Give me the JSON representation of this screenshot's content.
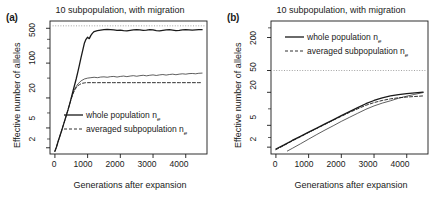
{
  "figure": {
    "width": 441,
    "height": 199,
    "background": "#ffffff",
    "line_color": "#1a1a1a",
    "ref_line_color": "#999999"
  },
  "panels": [
    {
      "id": "a",
      "label": "(a)",
      "title": "10 subpopulation, with migration",
      "xlabel": "Generations after expansion",
      "ylabel": "Effective number of alleles"
    },
    {
      "id": "b",
      "label": "(b)",
      "title": "10 subpopulation, with migration",
      "xlabel": "Generations after expansion",
      "ylabel": "Effective number of alleles"
    }
  ],
  "legend": {
    "whole_label": "whole population n",
    "whole_sub": "e",
    "averaged_label": "averaged subpopulation n",
    "averaged_sub": "e"
  },
  "chart_data": [
    {
      "type": "line",
      "panel": "a",
      "title": "10 subpopulation, with migration",
      "xlabel": "Generations after expansion",
      "ylabel": "Effective number of alleles",
      "xlim": [
        -150,
        4650
      ],
      "ylim": [
        1.5,
        700
      ],
      "yscale": "log",
      "xscale": "linear",
      "xticks": [
        0,
        1000,
        2000,
        3000,
        4000
      ],
      "xtick_labels": [
        "0",
        "1000",
        "2000",
        "3000",
        "4000"
      ],
      "yticks": [
        2,
        5,
        20,
        100,
        500
      ],
      "ytick_labels": [
        "2",
        "5",
        "20",
        "100",
        "500"
      ],
      "grid": false,
      "legend_position": "bottom-center",
      "reference_line": {
        "y": 560,
        "style": "dotted",
        "orientation": "horizontal"
      },
      "series": [
        {
          "name": "whole population ne",
          "style": "solid",
          "x": [
            0,
            50,
            100,
            150,
            200,
            250,
            300,
            350,
            400,
            450,
            500,
            550,
            600,
            650,
            700,
            750,
            800,
            850,
            900,
            950,
            1000,
            1050,
            1100,
            1150,
            1200,
            1300,
            1400,
            1500,
            1600,
            1700,
            1800,
            1900,
            2000,
            2100,
            2200,
            2300,
            2400,
            2500,
            2600,
            2700,
            2800,
            2900,
            3000,
            3100,
            3200,
            3300,
            3400,
            3500,
            3600,
            3700,
            3800,
            3900,
            4000,
            4100,
            4200,
            4300,
            4400,
            4500
          ],
          "y": [
            1.7,
            2.1,
            2.7,
            3.4,
            4.3,
            5.5,
            7.0,
            9.0,
            11.5,
            15.0,
            20.0,
            27.0,
            36.0,
            48.0,
            66.0,
            92.0,
            130.0,
            180.0,
            250.0,
            300.0,
            330.0,
            310.0,
            360.0,
            400.0,
            430.0,
            450.0,
            460.0,
            470.0,
            475.0,
            470.0,
            465.0,
            455.0,
            460.0,
            450.0,
            445.0,
            455.0,
            465.0,
            470.0,
            465.0,
            455.0,
            460.0,
            470.0,
            465.0,
            450.0,
            445.0,
            455.0,
            465.0,
            470.0,
            460.0,
            450.0,
            455.0,
            465.0,
            470.0,
            465.0,
            460.0,
            465.0,
            470.0,
            468.0
          ]
        },
        {
          "name": "averaged subpopulation ne",
          "style": "dashed",
          "x": [
            0,
            50,
            100,
            150,
            200,
            250,
            300,
            350,
            400,
            450,
            500,
            550,
            600,
            650,
            700,
            750,
            800,
            850,
            900,
            950,
            1000,
            1100,
            1200,
            1300,
            1400,
            1500,
            1600,
            1700,
            1800,
            1900,
            2000,
            2200,
            2400,
            2600,
            2800,
            3000,
            3200,
            3400,
            3600,
            3800,
            4000,
            4200,
            4400,
            4500
          ],
          "y": [
            1.7,
            2.1,
            2.7,
            3.4,
            4.3,
            5.5,
            7.0,
            9.0,
            11.5,
            15.0,
            19.0,
            24.0,
            28.5,
            32.0,
            35.0,
            37.0,
            38.5,
            39.5,
            40.0,
            40.5,
            40.5,
            40.5,
            40.5,
            40.5,
            40.5,
            40.5,
            40.5,
            40.5,
            40.5,
            40.5,
            40.5,
            40.5,
            40.5,
            40.5,
            40.5,
            40.5,
            40.5,
            40.5,
            40.5,
            40.5,
            40.5,
            40.5,
            40.5,
            40.5
          ]
        },
        {
          "name": "subpopulation observed (thin solid)",
          "style": "solid-thin",
          "x": [
            500,
            600,
            700,
            800,
            900,
            1000,
            1100,
            1200,
            1300,
            1400,
            1500,
            1600,
            1700,
            1800,
            1900,
            2000,
            2100,
            2200,
            2300,
            2400,
            2500,
            2600,
            2700,
            2800,
            2900,
            3000,
            3100,
            3200,
            3300,
            3400,
            3500,
            3600,
            3700,
            3800,
            3900,
            4000,
            4100,
            4200,
            4300,
            4400,
            4500
          ],
          "y": [
            20.0,
            30.0,
            38.0,
            44.0,
            48.0,
            50.0,
            51.0,
            52.0,
            51.0,
            52.5,
            53.0,
            52.0,
            53.5,
            54.0,
            52.5,
            54.0,
            55.0,
            53.5,
            55.0,
            56.0,
            54.5,
            56.0,
            57.0,
            55.5,
            57.0,
            58.0,
            56.5,
            58.0,
            59.0,
            57.5,
            59.0,
            60.0,
            58.5,
            60.0,
            61.0,
            60.0,
            61.5,
            62.0,
            61.0,
            62.5,
            63.0
          ]
        }
      ]
    },
    {
      "type": "line",
      "panel": "b",
      "title": "10 subpopulation, with migration",
      "xlabel": "Generations after expansion",
      "ylabel": "Effective number of alleles",
      "xlim": [
        -150,
        4650
      ],
      "ylim": [
        1.5,
        400
      ],
      "yscale": "log",
      "xscale": "linear",
      "xticks": [
        0,
        1000,
        2000,
        3000,
        4000
      ],
      "xtick_labels": [
        "0",
        "1000",
        "2000",
        "3000",
        "4000"
      ],
      "yticks": [
        2,
        5,
        20,
        50,
        200
      ],
      "ytick_labels": [
        "2",
        "5",
        "20",
        "50",
        "200"
      ],
      "grid": false,
      "legend_position": "top-center",
      "reference_line": {
        "y": 50,
        "style": "dotted",
        "orientation": "horizontal"
      },
      "series": [
        {
          "name": "whole population ne",
          "style": "solid",
          "x": [
            0,
            250,
            500,
            750,
            1000,
            1250,
            1500,
            1750,
            2000,
            2250,
            2500,
            2750,
            3000,
            3250,
            3500,
            3750,
            4000,
            4250,
            4500
          ],
          "y": [
            1.85,
            2.2,
            2.65,
            3.15,
            3.75,
            4.45,
            5.3,
            6.3,
            7.5,
            8.9,
            10.5,
            12.4,
            14.2,
            15.8,
            17.2,
            18.2,
            19.0,
            19.6,
            20.2
          ]
        },
        {
          "name": "averaged subpopulation ne",
          "style": "dashed",
          "x": [
            0,
            250,
            500,
            750,
            1000,
            1250,
            1500,
            1750,
            2000,
            2250,
            2500,
            2750,
            3000,
            3250,
            3500,
            3750,
            4000,
            4250,
            4500
          ],
          "y": [
            1.8,
            2.15,
            2.6,
            3.1,
            3.7,
            4.4,
            5.2,
            6.2,
            7.3,
            8.6,
            10.0,
            11.6,
            13.0,
            14.2,
            15.2,
            15.9,
            16.4,
            16.8,
            17.2
          ]
        },
        {
          "name": "subpopulation observed (thin solid lower)",
          "style": "solid-thin",
          "x": [
            350,
            500,
            750,
            1000,
            1250,
            1500,
            1750,
            2000,
            2250,
            2500,
            2750,
            3000,
            3250,
            3500,
            3750,
            4000,
            4250,
            4500
          ],
          "y": [
            1.7,
            1.9,
            2.3,
            2.8,
            3.4,
            4.1,
            4.9,
            5.9,
            7.0,
            8.3,
            9.8,
            11.3,
            12.7,
            14.0,
            15.6,
            17.0,
            18.4,
            19.8
          ]
        }
      ]
    }
  ]
}
